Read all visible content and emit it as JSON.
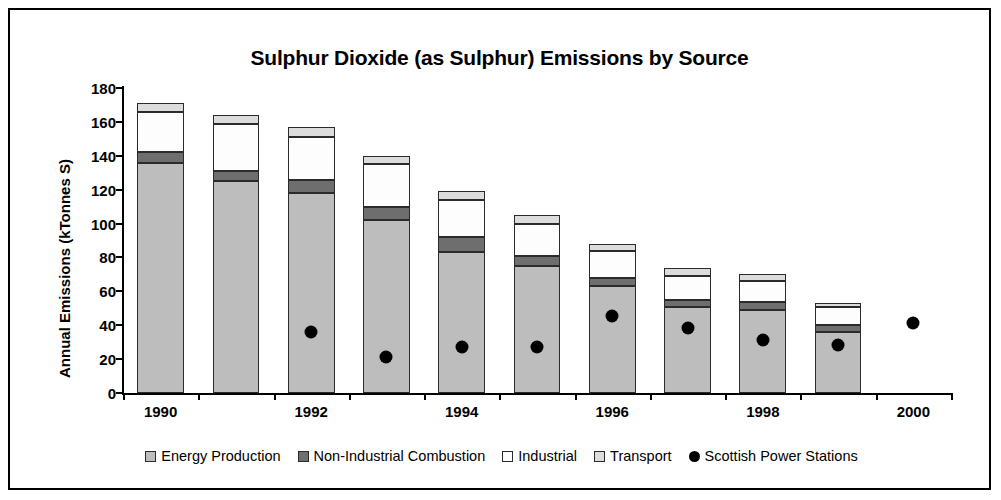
{
  "chart_data": {
    "type": "bar",
    "stacked": true,
    "title": "Sulphur Dioxide (as Sulphur) Emissions by Source",
    "xlabel": "",
    "ylabel": "Annual Emissions (kTonnes S)",
    "ylim": [
      0,
      180
    ],
    "ytick_step": 20,
    "yticks": [
      0,
      20,
      40,
      60,
      80,
      100,
      120,
      140,
      160,
      180
    ],
    "grid": false,
    "legend_position": "bottom",
    "categories": [
      1990,
      1991,
      1992,
      1993,
      1994,
      1995,
      1996,
      1997,
      1998,
      1999,
      2000
    ],
    "xtick_labels": [
      "1990",
      "1992",
      "1994",
      "1996",
      "1998",
      "2000"
    ],
    "xtick_label_years": [
      1990,
      1992,
      1994,
      1996,
      1998,
      2000
    ],
    "series": [
      {
        "name": "Energy Production",
        "key": "energy",
        "color": "#bdbdbd",
        "values": [
          136,
          125,
          118,
          102,
          83,
          75,
          63,
          51,
          49,
          36,
          null
        ]
      },
      {
        "name": "Non-Industrial Combustion",
        "key": "nonind",
        "color": "#6e6e6e",
        "values": [
          6,
          6,
          8,
          8,
          9,
          6,
          5,
          4,
          5,
          4,
          null
        ]
      },
      {
        "name": "Industrial",
        "key": "indus",
        "color": "#fdfdfd",
        "values": [
          24,
          28,
          25,
          25,
          22,
          19,
          16,
          14,
          12,
          11,
          null
        ]
      },
      {
        "name": "Transport",
        "key": "trans",
        "color": "#dcdcdc",
        "values": [
          5,
          5,
          6,
          5,
          5,
          5,
          4,
          5,
          4,
          2,
          null
        ]
      }
    ],
    "totals": [
      171,
      164,
      157,
      140,
      119,
      105,
      88,
      74,
      70,
      53,
      null
    ],
    "scatter_series": {
      "name": "Scottish Power Stations",
      "marker": "filled-circle",
      "color": "#000000",
      "points": [
        {
          "x": 1992,
          "y": 40
        },
        {
          "x": 1993,
          "y": 25
        },
        {
          "x": 1994,
          "y": 31
        },
        {
          "x": 1995,
          "y": 31
        },
        {
          "x": 1996,
          "y": 49
        },
        {
          "x": 1997,
          "y": 42
        },
        {
          "x": 1998,
          "y": 35
        },
        {
          "x": 1999,
          "y": 32
        },
        {
          "x": 2000,
          "y": 45
        }
      ]
    }
  },
  "legend": {
    "items": [
      {
        "label": "Energy Production",
        "key": "energy"
      },
      {
        "label": "Non-Industrial Combustion",
        "key": "nonind"
      },
      {
        "label": "Industrial",
        "key": "indus"
      },
      {
        "label": "Transport",
        "key": "trans"
      },
      {
        "label": "Scottish Power Stations",
        "key": "dot"
      }
    ]
  }
}
